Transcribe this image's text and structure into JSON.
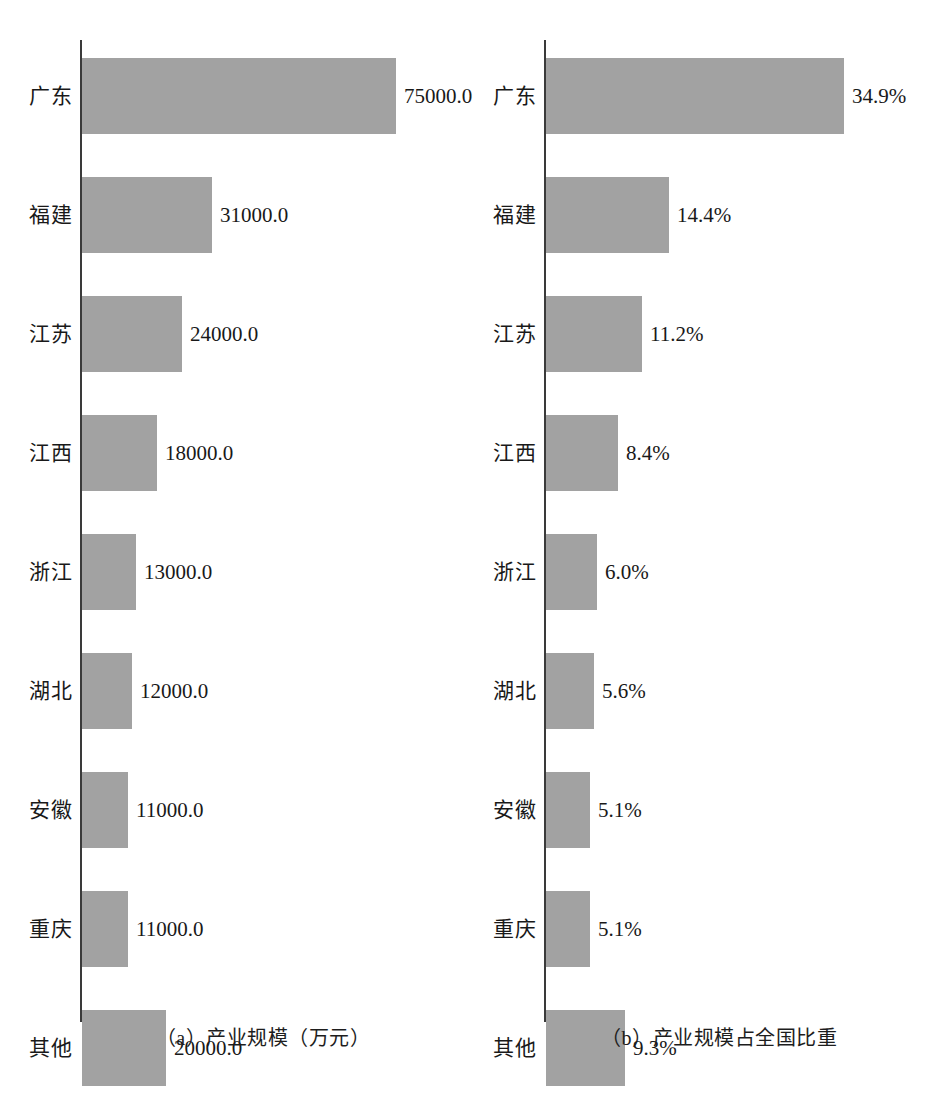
{
  "chart_data": [
    {
      "type": "bar",
      "orientation": "horizontal",
      "panel": "a",
      "title": "（a）产业规模（万元）",
      "xlabel": "",
      "ylabel": "",
      "unit": "万元",
      "grid": false,
      "legend": "none",
      "xlim": [
        0,
        75000
      ],
      "categories": [
        "广东",
        "福建",
        "江苏",
        "江西",
        "浙江",
        "湖北",
        "安徽",
        "重庆",
        "其他"
      ],
      "values": [
        75000.0,
        31000.0,
        24000.0,
        18000.0,
        13000.0,
        12000.0,
        11000.0,
        11000.0,
        20000.0
      ],
      "value_labels": [
        "75000.0",
        "31000.0",
        "24000.0",
        "18000.0",
        "13000.0",
        "12000.0",
        "11000.0",
        "11000.0",
        "20000.0"
      ]
    },
    {
      "type": "bar",
      "orientation": "horizontal",
      "panel": "b",
      "title": "（b）产业规模占全国比重",
      "xlabel": "",
      "ylabel": "",
      "unit": "%",
      "grid": false,
      "legend": "none",
      "xlim": [
        0,
        34.9
      ],
      "categories": [
        "广东",
        "福建",
        "江苏",
        "江西",
        "浙江",
        "湖北",
        "安徽",
        "重庆",
        "其他"
      ],
      "values": [
        34.9,
        14.4,
        11.2,
        8.4,
        6.0,
        5.6,
        5.1,
        5.1,
        9.3
      ],
      "value_labels": [
        "34.9%",
        "14.4%",
        "11.2%",
        "8.4%",
        "6.0%",
        "5.6%",
        "5.1%",
        "5.1%",
        "9.3%"
      ]
    }
  ],
  "style": {
    "bar_color": "#a2a2a2",
    "axis_color": "#3a3a3a",
    "text_color": "#191919",
    "background": "#ffffff"
  }
}
